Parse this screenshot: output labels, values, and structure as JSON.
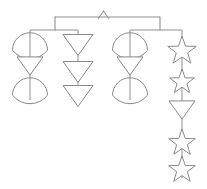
{
  "diagram": {
    "background_color": "#ffffff",
    "line_color": "#909090",
    "shape_stroke_color": "#8a8a8a",
    "shape_fill_color": "#ffffff",
    "canvas": {
      "width": 207,
      "height": 189
    }
  },
  "frame": {
    "hook": {
      "name": "hook",
      "apex_x": 103.5,
      "apex_y": 11.0,
      "left_x": 98.0,
      "right_x": 109.0,
      "bottom_y": 19.0
    },
    "top_bar": {
      "name": "top-crossbar",
      "x1": 55.0,
      "x2": 160.0,
      "y": 17.0
    },
    "top_drop_left": {
      "x": 55.0,
      "y1": 17.0,
      "y2": 30.0
    },
    "top_drop_right": {
      "x": 160.0,
      "y1": 17.0,
      "y2": 30.0
    },
    "sub_bar_left": {
      "name": "left-crossbar",
      "x1": 30.0,
      "x2": 78.0,
      "y": 30.0
    },
    "sub_bar_right": {
      "name": "right-crossbar",
      "x1": 130.0,
      "x2": 182.0,
      "y": 30.0
    }
  },
  "strands": [
    {
      "name": "strand-1",
      "center_x": 30.0,
      "top_y": 30.0,
      "bottom_y": 100.0,
      "shapes": [
        {
          "type": "crescent",
          "cy": 45.0,
          "size": 17.5
        },
        {
          "type": "triangle-down",
          "cy": 66.0,
          "size": 13.0
        },
        {
          "type": "crescent",
          "cy": 90.0,
          "size": 17.5
        }
      ]
    },
    {
      "name": "strand-2",
      "center_x": 78.0,
      "top_y": 30.0,
      "bottom_y": 105.0,
      "shapes": [
        {
          "type": "triangle-down",
          "cy": 45.0,
          "size": 15.0
        },
        {
          "type": "triangle-down",
          "cy": 72.0,
          "size": 15.0
        },
        {
          "type": "triangle-down",
          "cy": 96.0,
          "size": 15.0
        }
      ]
    },
    {
      "name": "strand-3",
      "center_x": 130.0,
      "top_y": 30.0,
      "bottom_y": 100.0,
      "shapes": [
        {
          "type": "crescent",
          "cy": 45.0,
          "size": 17.5
        },
        {
          "type": "triangle-down",
          "cy": 66.0,
          "size": 13.0
        },
        {
          "type": "crescent",
          "cy": 90.0,
          "size": 17.5
        }
      ]
    },
    {
      "name": "strand-4",
      "center_x": 182.0,
      "top_y": 30.0,
      "bottom_y": 178.0,
      "shapes": [
        {
          "type": "star",
          "cy": 51.0,
          "size": 15.0
        },
        {
          "type": "star",
          "cy": 82.0,
          "size": 13.0
        },
        {
          "type": "triangle-down",
          "cy": 110.0,
          "size": 13.0
        },
        {
          "type": "star",
          "cy": 143.0,
          "size": 14.0
        },
        {
          "type": "star",
          "cy": 170.0,
          "size": 14.0
        }
      ]
    }
  ],
  "legend": {
    "shape_names": {
      "crescent": "crescent-shape",
      "triangle-down": "triangle-down-shape",
      "star": "star-shape"
    },
    "counts": {
      "crescent": 4,
      "triangle_down": 6,
      "star": 4
    }
  }
}
